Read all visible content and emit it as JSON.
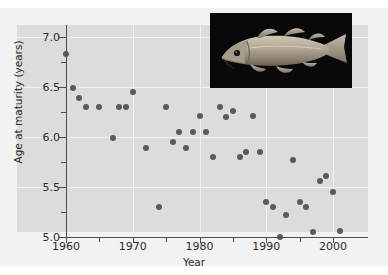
{
  "figure": {
    "panel_bg": "#dcdcdc",
    "figure_bg": "#f2f2f2",
    "point_color": "#5a5a5a",
    "grid_color": "#f0f0f0",
    "axis_color": "#4d4d4d",
    "inset_alt": "photograph of an Atlantic cod fish on black background"
  },
  "chart_data": {
    "type": "scatter",
    "title": "",
    "xlabel": "Year",
    "ylabel": "Age at maturity (years)",
    "xlim": [
      1958,
      2003
    ],
    "ylim": [
      5.0,
      7.05
    ],
    "grid": true,
    "legend": null,
    "xticks": [
      1960,
      1970,
      1980,
      1990,
      2000
    ],
    "xtick_labels": [
      "1960",
      "1970",
      "1980",
      "1990",
      "2000"
    ],
    "xminor_ticks": [
      1965,
      1975,
      1985,
      1995
    ],
    "yticks": [
      5.0,
      5.5,
      6.0,
      6.5,
      7.0
    ],
    "ytick_labels": [
      "5.0",
      "5.5",
      "6.0",
      "6.5",
      "7.0"
    ],
    "yminor_ticks": [
      5.25,
      5.75,
      6.25,
      6.75
    ],
    "x": [
      1960,
      1961,
      1962,
      1963,
      1965,
      1967,
      1968,
      1969,
      1970,
      1972,
      1974,
      1975,
      1976,
      1977,
      1978,
      1979,
      1980,
      1981,
      1982,
      1983,
      1984,
      1985,
      1986,
      1987,
      1988,
      1989,
      1990,
      1991,
      1992,
      1993,
      1994,
      1995,
      1996,
      1997,
      1998,
      1999,
      2000,
      2001
    ],
    "y": [
      6.83,
      6.49,
      6.39,
      6.3,
      6.3,
      5.99,
      6.3,
      6.3,
      6.45,
      5.89,
      5.3,
      6.3,
      5.95,
      6.05,
      5.89,
      6.05,
      6.21,
      6.05,
      5.8,
      6.3,
      6.2,
      6.26,
      5.8,
      5.85,
      6.21,
      5.85,
      5.35,
      5.3,
      5.0,
      5.22,
      5.77,
      5.35,
      5.3,
      5.05,
      5.56,
      5.61,
      5.45,
      5.06
    ],
    "points": [
      {
        "x": 1960,
        "y": 6.83
      },
      {
        "x": 1961,
        "y": 6.49
      },
      {
        "x": 1962,
        "y": 6.39
      },
      {
        "x": 1963,
        "y": 6.3
      },
      {
        "x": 1965,
        "y": 6.3
      },
      {
        "x": 1967,
        "y": 5.99
      },
      {
        "x": 1968,
        "y": 6.3
      },
      {
        "x": 1969,
        "y": 6.3
      },
      {
        "x": 1970,
        "y": 6.45
      },
      {
        "x": 1972,
        "y": 5.89
      },
      {
        "x": 1974,
        "y": 5.3
      },
      {
        "x": 1975,
        "y": 6.3
      },
      {
        "x": 1976,
        "y": 5.95
      },
      {
        "x": 1977,
        "y": 6.05
      },
      {
        "x": 1978,
        "y": 5.89
      },
      {
        "x": 1979,
        "y": 6.05
      },
      {
        "x": 1980,
        "y": 6.21
      },
      {
        "x": 1981,
        "y": 6.05
      },
      {
        "x": 1982,
        "y": 5.8
      },
      {
        "x": 1983,
        "y": 6.3
      },
      {
        "x": 1984,
        "y": 6.2
      },
      {
        "x": 1985,
        "y": 6.26
      },
      {
        "x": 1986,
        "y": 5.8
      },
      {
        "x": 1987,
        "y": 5.85
      },
      {
        "x": 1988,
        "y": 6.21
      },
      {
        "x": 1989,
        "y": 5.85
      },
      {
        "x": 1990,
        "y": 5.35
      },
      {
        "x": 1991,
        "y": 5.3
      },
      {
        "x": 1992,
        "y": 5.0
      },
      {
        "x": 1993,
        "y": 5.22
      },
      {
        "x": 1994,
        "y": 5.77
      },
      {
        "x": 1995,
        "y": 5.35
      },
      {
        "x": 1996,
        "y": 5.3
      },
      {
        "x": 1997,
        "y": 5.05
      },
      {
        "x": 1998,
        "y": 5.56
      },
      {
        "x": 1999,
        "y": 5.61
      },
      {
        "x": 2000,
        "y": 5.45
      },
      {
        "x": 2001,
        "y": 5.06
      }
    ]
  }
}
